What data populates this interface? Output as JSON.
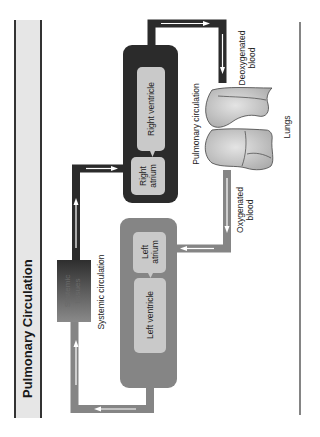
{
  "title": "Pulmonary Circulation",
  "colors": {
    "deoxygenated": "#2b2b2b",
    "oxygenated": "#858585",
    "chamber_fill": "#c9c9c9",
    "title_bar": "#e6e6e6",
    "lung_fill": "#c2c2c2"
  },
  "labels": {
    "right_ventricle": "Right ventricle",
    "right_atrium_line1": "Right",
    "right_atrium_line2": "atrium",
    "left_atrium_line1": "Left",
    "left_atrium_line2": "atrium",
    "left_ventricle": "Left ventricle",
    "systemic_tissues_line1": "Systemic",
    "systemic_tissues_line2": "tissues",
    "systemic_circulation": "Systemic circulation",
    "pulmonary_circulation": "Pulmonary circulation",
    "lungs": "Lungs",
    "deoxygenated_line1": "Deoxygenated",
    "deoxygenated_line2": "blood",
    "oxygenated_line1": "Oxygenated",
    "oxygenated_line2": "blood"
  }
}
